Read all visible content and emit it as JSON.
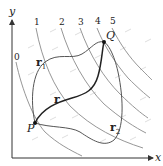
{
  "diagram": {
    "axes": {
      "x_label": "x",
      "y_label": "y"
    },
    "level_curves": [
      {
        "label": "0"
      },
      {
        "label": "1"
      },
      {
        "label": "2"
      },
      {
        "label": "3"
      },
      {
        "label": "4"
      },
      {
        "label": "5"
      }
    ],
    "points": {
      "start": {
        "label": "P"
      },
      "end": {
        "label": "Q"
      }
    },
    "paths": [
      {
        "name": "r",
        "label": "r",
        "subscript": ""
      },
      {
        "name": "r1",
        "label": "r",
        "subscript": "1"
      },
      {
        "name": "r2",
        "label": "r",
        "subscript": "2"
      }
    ],
    "colors": {
      "axis": "#333333",
      "level_curve": "#8a8a8a",
      "path_main": "#222222",
      "path_alt": "#666666",
      "field_arrows": "#d0d0d0"
    }
  }
}
